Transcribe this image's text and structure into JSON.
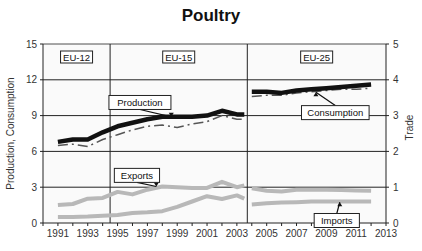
{
  "chart_data": {
    "type": "line",
    "title": "Poultry",
    "xlabel": "",
    "ylabel": "Production, Consumption",
    "y2label": "Trade",
    "ylim": [
      0,
      15
    ],
    "y2lim": [
      0,
      5
    ],
    "yticks": [
      0,
      3,
      6,
      9,
      12,
      15
    ],
    "y2ticks": [
      0,
      1,
      2,
      3,
      4,
      5
    ],
    "xlim": [
      1990,
      2013
    ],
    "xticks": [
      1991,
      1993,
      1995,
      1997,
      1999,
      2001,
      2003,
      2005,
      2007,
      2009,
      2011,
      2013
    ],
    "grid": "horizontal",
    "regions": [
      {
        "label": "EU-12",
        "x_start": 1990,
        "x_end": 1994.5
      },
      {
        "label": "EU-15",
        "x_start": 1994.5,
        "x_end": 2003.7
      },
      {
        "label": "EU-25",
        "x_start": 2003.7,
        "x_end": 2013
      }
    ],
    "series": [
      {
        "name": "Production",
        "axis": "left",
        "style": "thick-black",
        "segments": [
          {
            "x": [
              1991,
              1992,
              1993,
              1994,
              1995,
              1996,
              1997,
              1998,
              1999,
              2000,
              2001,
              2002,
              2003,
              2003.5
            ],
            "values": [
              6.8,
              7.0,
              7.0,
              7.6,
              8.1,
              8.4,
              8.7,
              8.9,
              8.9,
              8.9,
              9.0,
              9.4,
              9.1,
              9.1
            ]
          },
          {
            "x": [
              2004,
              2005,
              2006,
              2007,
              2008,
              2009,
              2010,
              2011,
              2012
            ],
            "values": [
              11.0,
              11.0,
              10.9,
              11.1,
              11.2,
              11.3,
              11.4,
              11.5,
              11.6
            ]
          }
        ]
      },
      {
        "name": "Consumption",
        "axis": "left",
        "style": "dash-dot-gray",
        "segments": [
          {
            "x": [
              1991,
              1992,
              1993,
              1994,
              1995,
              1996,
              1997,
              1998,
              1999,
              2000,
              2001,
              2002,
              2003,
              2003.5
            ],
            "values": [
              6.5,
              6.6,
              6.4,
              7.0,
              7.4,
              7.8,
              8.1,
              8.2,
              8.0,
              8.3,
              8.5,
              9.0,
              8.7,
              8.7
            ]
          },
          {
            "x": [
              2004,
              2005,
              2006,
              2007,
              2008,
              2009,
              2010,
              2011,
              2012
            ],
            "values": [
              10.6,
              10.7,
              10.7,
              10.9,
              11.0,
              11.1,
              11.2,
              11.2,
              11.3
            ]
          }
        ]
      },
      {
        "name": "Exports",
        "axis": "right",
        "style": "thick-lightgray",
        "segments": [
          {
            "x": [
              1991,
              1992,
              1993,
              1994,
              1995,
              1996,
              1997,
              1998,
              1999,
              2000,
              2001,
              2002,
              2003,
              2003.5
            ],
            "values": [
              0.5,
              0.53,
              0.68,
              0.7,
              0.87,
              0.8,
              0.93,
              1.02,
              1.0,
              0.98,
              0.98,
              1.15,
              1.0,
              1.05
            ]
          },
          {
            "x": [
              2004,
              2005,
              2006,
              2007,
              2008,
              2009,
              2010,
              2011,
              2012
            ],
            "values": [
              0.97,
              0.9,
              0.88,
              0.93,
              0.93,
              0.93,
              0.92,
              0.91,
              0.9
            ]
          }
        ]
      },
      {
        "name": "Imports",
        "axis": "right",
        "style": "thick-lightgray",
        "segments": [
          {
            "x": [
              1991,
              1992,
              1993,
              1994,
              1995,
              1996,
              1997,
              1998,
              1999,
              2000,
              2001,
              2002,
              2003,
              2003.5
            ],
            "values": [
              0.17,
              0.17,
              0.18,
              0.2,
              0.22,
              0.28,
              0.3,
              0.33,
              0.45,
              0.6,
              0.75,
              0.67,
              0.77,
              0.68
            ]
          },
          {
            "x": [
              2004,
              2005,
              2006,
              2007,
              2008,
              2009,
              2010,
              2011,
              2012
            ],
            "values": [
              0.52,
              0.55,
              0.57,
              0.58,
              0.6,
              0.6,
              0.6,
              0.6,
              0.6
            ]
          }
        ]
      }
    ],
    "annotations": [
      {
        "text": "Production",
        "box_x": 1996.5,
        "box_y": 10.1,
        "point_x": 1998.6,
        "point_y": 8.9
      },
      {
        "text": "Consumption",
        "box_x": 2009.6,
        "box_y": 9.25,
        "point_x": 2008.3,
        "point_y": 10.95
      },
      {
        "text": "Exports",
        "box_x": 1996.3,
        "box_y": 1.33,
        "point_x": 1997.6,
        "point_y": 1.02
      },
      {
        "text": "Imports",
        "box_x": 2009.7,
        "box_y": 0.07,
        "point_x": 2009.9,
        "point_y": 0.58
      }
    ]
  }
}
